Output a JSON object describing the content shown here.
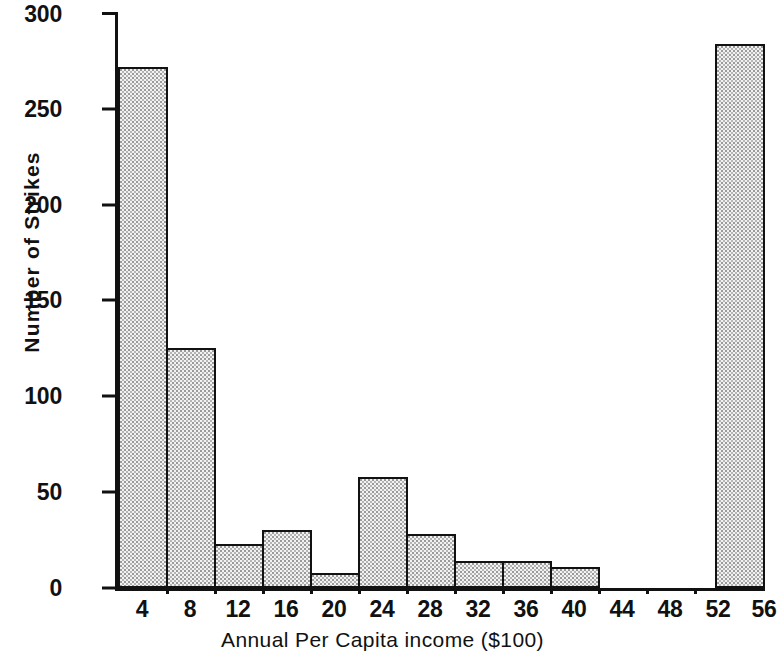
{
  "chart_data": {
    "type": "bar",
    "title": "",
    "subtitle": "",
    "xlabel": "Annual Per Capita income ($100)",
    "ylabel": "Number of Strikes",
    "categories": [
      "4",
      "8",
      "12",
      "16",
      "20",
      "24",
      "28",
      "32",
      "36",
      "40",
      "44",
      "48",
      "52",
      "56"
    ],
    "values": [
      272,
      125,
      23,
      30,
      8,
      58,
      28,
      14,
      14,
      11,
      0,
      0,
      0,
      284
    ],
    "xlim": [
      0,
      58
    ],
    "ylim": [
      0,
      300
    ],
    "yticks": [
      0,
      50,
      100,
      150,
      200,
      250,
      300
    ],
    "ytick_labels": [
      "0",
      "50",
      "100",
      "150",
      "200",
      "250",
      "300"
    ],
    "grid": false,
    "legend": null,
    "legend_position": "none",
    "bar_style": {
      "fill": "#f2f2f2",
      "pattern": "stipple-dots",
      "edge": "#111111"
    }
  }
}
